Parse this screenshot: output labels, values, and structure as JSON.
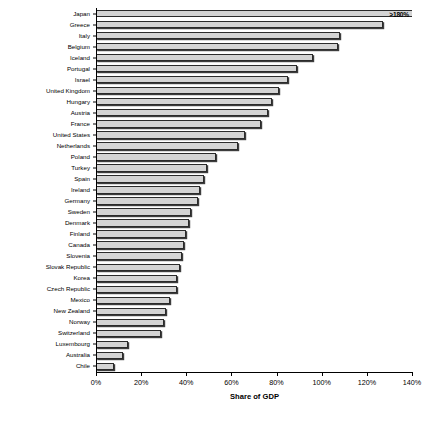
{
  "chart_data": {
    "type": "bar",
    "orientation": "horizontal",
    "title": "",
    "xlabel": "Share of GDP",
    "ylabel": "",
    "xlim": [
      0,
      140
    ],
    "grid": false,
    "legend": null,
    "xticks": [
      "0%",
      "20%",
      "40%",
      "60%",
      "80%",
      "100%",
      "120%",
      "140%"
    ],
    "xtick_values": [
      0,
      20,
      40,
      60,
      80,
      100,
      120,
      140
    ],
    "categories": [
      "Japan",
      "Greece",
      "Italy",
      "Belgium",
      "Iceland",
      "Portugal",
      "Israel",
      "United Kingdom",
      "Hungary",
      "Austria",
      "France",
      "United States",
      "Netherlands",
      "Poland",
      "Turkey",
      "Spain",
      "Ireland",
      "Germany",
      "Sweden",
      "Denmark",
      "Finland",
      "Canada",
      "Slovenia",
      "Slovak Republic",
      "Korea",
      "Czech Republic",
      "Mexico",
      "New Zealand",
      "Norway",
      "Switzerland",
      "Luxembourg",
      "Australia",
      "Chile"
    ],
    "values": [
      180,
      127,
      108,
      107,
      96,
      89,
      85,
      81,
      78,
      76,
      73,
      66,
      63,
      53,
      49,
      48,
      46,
      45,
      42,
      41,
      40,
      39,
      38,
      37,
      36,
      36,
      33,
      31,
      30,
      29,
      14,
      12,
      8
    ],
    "annotations": [
      {
        "category": "Japan",
        "text": ">180%",
        "clipped": true
      }
    ],
    "bar_fill_color": "#d4d4d4",
    "bar_edge_color": "#2b2b2b",
    "background_color": "#ffffff"
  }
}
